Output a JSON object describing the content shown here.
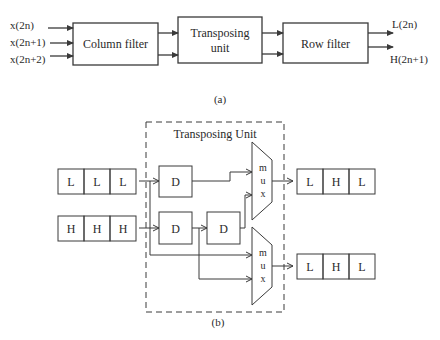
{
  "part_a": {
    "inputs": [
      "x(2n)",
      "x(2n+1)",
      "x(2n+2)"
    ],
    "blocks": [
      {
        "label": [
          "Column filter"
        ]
      },
      {
        "label": [
          "Transposing",
          "unit"
        ]
      },
      {
        "label": [
          "Row filter"
        ]
      }
    ],
    "outputs": [
      "L(2n)",
      "H(2n+1)"
    ],
    "caption": "(a)"
  },
  "part_b": {
    "unit_title": "Transposing Unit",
    "input_L": [
      "L",
      "L",
      "L"
    ],
    "input_H": [
      "H",
      "H",
      "H"
    ],
    "delay_label": "D",
    "mux_letters": [
      "m",
      "u",
      "x"
    ],
    "output_1": [
      "L",
      "H",
      "L"
    ],
    "output_2": [
      "L",
      "H",
      "L"
    ],
    "caption": "(b)"
  },
  "colors": {
    "line": "#3a3a3a",
    "text": "#2a2a2a",
    "background": "#ffffff"
  }
}
